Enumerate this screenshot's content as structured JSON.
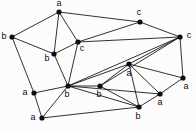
{
  "figure": {
    "kind": "labeled-graph-diagram",
    "background_color": "#fcfcfc",
    "edge_color": "#1a1a1a",
    "vertex_color": "#0d0d0d",
    "label_color": "#0d0d0d",
    "width": 196,
    "height": 130
  },
  "chart_data": {
    "type": "scatter",
    "title": "",
    "xlabel": "",
    "ylabel": "",
    "grid": false,
    "legend": null,
    "nodes": [
      {
        "id": "n0",
        "label": "a",
        "x": 59,
        "y": 12,
        "label_x": 59,
        "label_y": 4
      },
      {
        "id": "n1",
        "label": "b",
        "x": 12,
        "y": 37,
        "label_x": 4,
        "label_y": 37
      },
      {
        "id": "n2",
        "label": "b",
        "x": 54,
        "y": 54,
        "label_x": 47,
        "label_y": 59
      },
      {
        "id": "n3",
        "label": "c",
        "x": 78,
        "y": 42,
        "label_x": 82,
        "label_y": 49
      },
      {
        "id": "n4",
        "label": "c",
        "x": 140,
        "y": 22,
        "label_x": 139,
        "label_y": 13
      },
      {
        "id": "n5",
        "label": "c",
        "x": 180,
        "y": 37,
        "label_x": 189,
        "label_y": 36
      },
      {
        "id": "n6",
        "label": "a",
        "x": 34,
        "y": 93,
        "label_x": 25,
        "label_y": 93
      },
      {
        "id": "n7",
        "label": "b",
        "x": 68,
        "y": 86,
        "label_x": 67,
        "label_y": 95
      },
      {
        "id": "n8",
        "label": "a",
        "x": 42,
        "y": 118,
        "label_x": 33,
        "label_y": 118
      },
      {
        "id": "n9",
        "label": "b",
        "x": 100,
        "y": 86,
        "label_x": 99,
        "label_y": 95
      },
      {
        "id": "n10",
        "label": "a",
        "x": 129,
        "y": 64,
        "label_x": 129,
        "label_y": 74
      },
      {
        "id": "n11",
        "label": "a",
        "x": 160,
        "y": 94,
        "label_x": 160,
        "label_y": 103
      },
      {
        "id": "n12",
        "label": "a",
        "x": 183,
        "y": 78,
        "label_x": 186,
        "label_y": 87
      },
      {
        "id": "n13",
        "label": "b",
        "x": 139,
        "y": 107,
        "label_x": 138,
        "label_y": 117
      }
    ],
    "edges": [
      [
        "n0",
        "n1"
      ],
      [
        "n0",
        "n2"
      ],
      [
        "n0",
        "n3"
      ],
      [
        "n0",
        "n4"
      ],
      [
        "n1",
        "n2"
      ],
      [
        "n1",
        "n6"
      ],
      [
        "n2",
        "n3"
      ],
      [
        "n2",
        "n7"
      ],
      [
        "n3",
        "n4"
      ],
      [
        "n3",
        "n5"
      ],
      [
        "n3",
        "n7"
      ],
      [
        "n4",
        "n5"
      ],
      [
        "n5",
        "n7"
      ],
      [
        "n5",
        "n9"
      ],
      [
        "n5",
        "n10"
      ],
      [
        "n5",
        "n12"
      ],
      [
        "n6",
        "n7"
      ],
      [
        "n6",
        "n8"
      ],
      [
        "n7",
        "n8"
      ],
      [
        "n7",
        "n9"
      ],
      [
        "n7",
        "n10"
      ],
      [
        "n7",
        "n11"
      ],
      [
        "n7",
        "n13"
      ],
      [
        "n8",
        "n13"
      ],
      [
        "n9",
        "n10"
      ],
      [
        "n9",
        "n13"
      ],
      [
        "n10",
        "n11"
      ],
      [
        "n10",
        "n12"
      ],
      [
        "n10",
        "n13"
      ],
      [
        "n11",
        "n12"
      ],
      [
        "n11",
        "n13"
      ]
    ],
    "node_count": 14,
    "edge_count": 31,
    "label_alphabet": [
      "a",
      "b",
      "c"
    ]
  }
}
